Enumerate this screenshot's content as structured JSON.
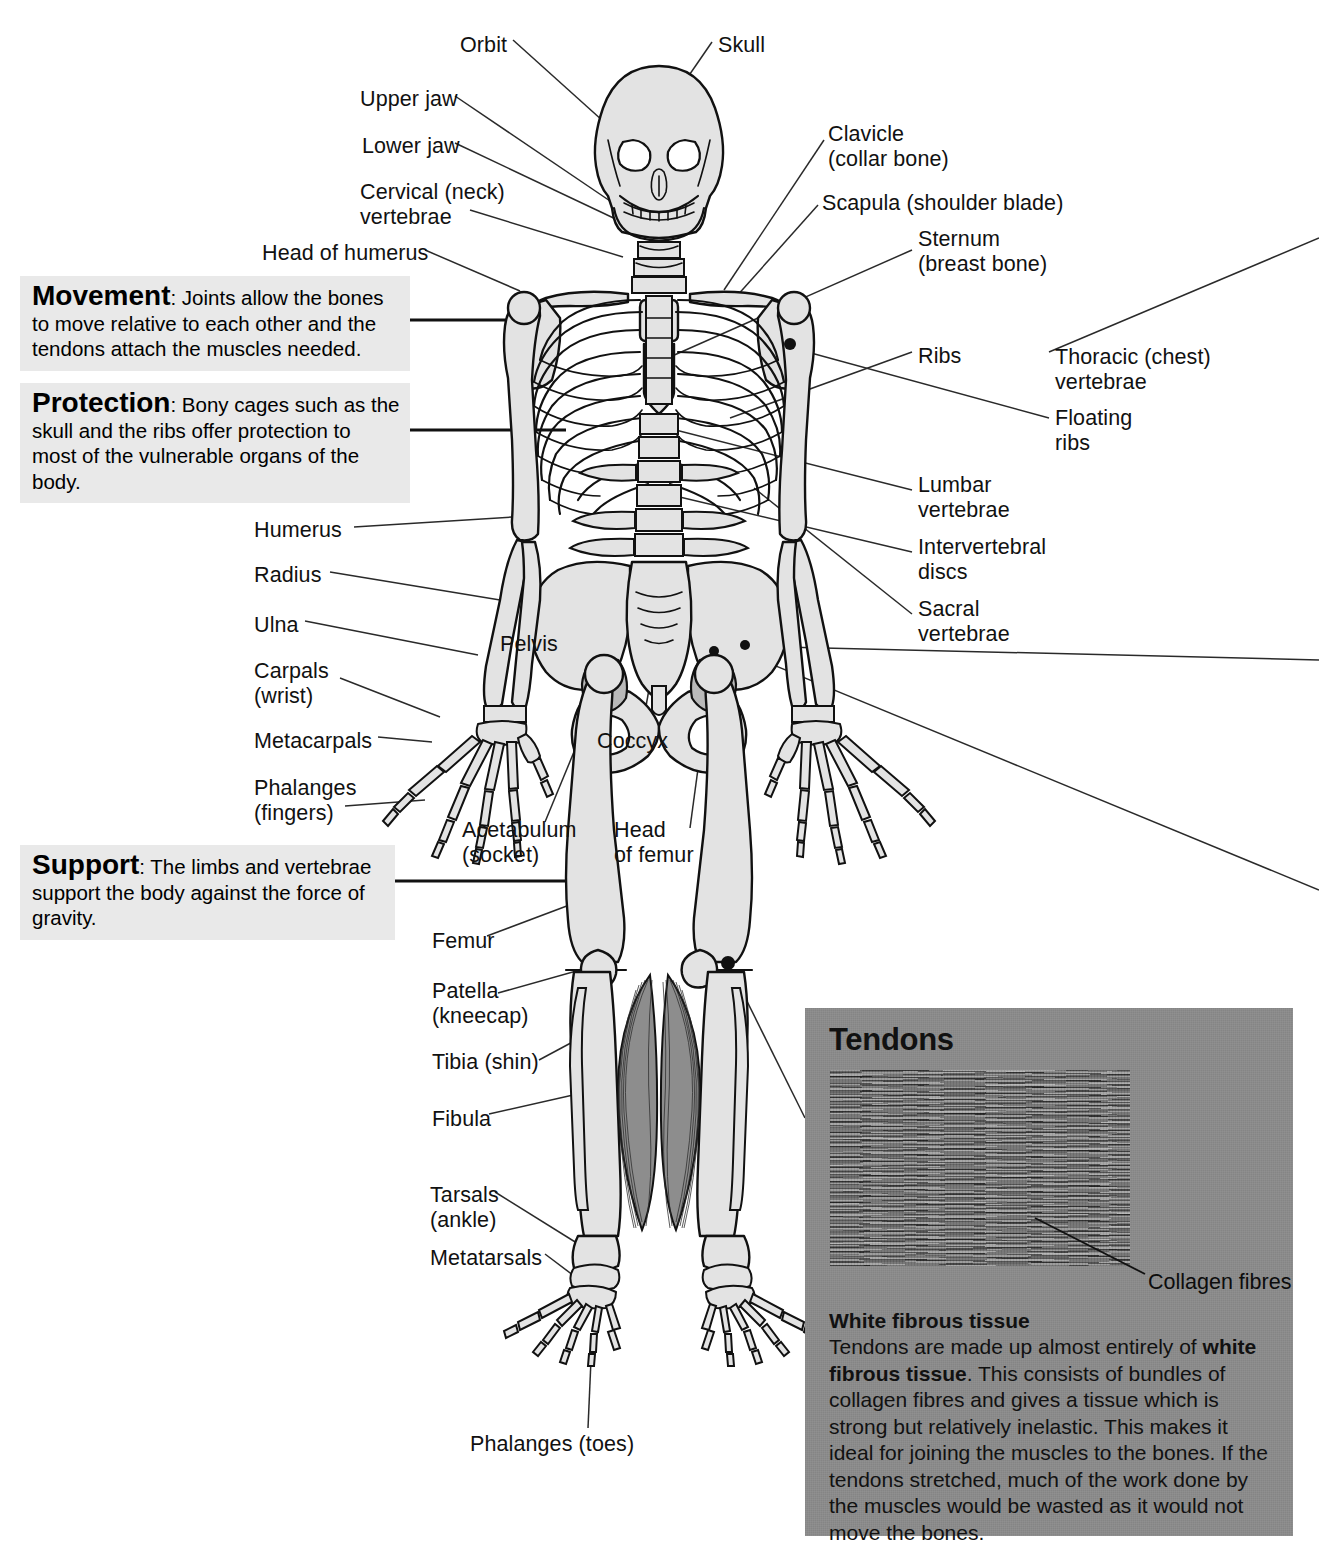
{
  "diagram": {
    "figure_name": "skeleton"
  },
  "labels_left": [
    {
      "name": "orbit",
      "text": "Orbit",
      "x": 460,
      "y": 33
    },
    {
      "name": "upper-jaw",
      "text": "Upper jaw",
      "x": 360,
      "y": 87
    },
    {
      "name": "lower-jaw",
      "text": "Lower jaw",
      "x": 362,
      "y": 134
    },
    {
      "name": "cervical-vertebrae",
      "text": "Cervical (neck)\nvertebrae",
      "x": 360,
      "y": 180
    },
    {
      "name": "head-of-humerus",
      "text": "Head of humerus",
      "x": 262,
      "y": 241
    },
    {
      "name": "humerus",
      "text": "Humerus",
      "x": 254,
      "y": 518
    },
    {
      "name": "radius",
      "text": "Radius",
      "x": 254,
      "y": 563
    },
    {
      "name": "ulna",
      "text": "Ulna",
      "x": 254,
      "y": 613
    },
    {
      "name": "carpals",
      "text": "Carpals\n(wrist)",
      "x": 254,
      "y": 659
    },
    {
      "name": "metacarpals",
      "text": "Metacarpals",
      "x": 254,
      "y": 729
    },
    {
      "name": "phalanges-fingers",
      "text": "Phalanges\n(fingers)",
      "x": 254,
      "y": 776
    },
    {
      "name": "pelvis",
      "text": "Pelvis",
      "x": 500,
      "y": 632
    },
    {
      "name": "coccyx",
      "text": "Coccyx",
      "x": 597,
      "y": 729
    },
    {
      "name": "acetabulum",
      "text": "Acetabulum\n(socket)",
      "x": 462,
      "y": 818
    },
    {
      "name": "head-of-femur",
      "text": "Head\nof femur",
      "x": 614,
      "y": 818
    },
    {
      "name": "femur",
      "text": "Femur",
      "x": 432,
      "y": 929
    },
    {
      "name": "patella",
      "text": "Patella\n(kneecap)",
      "x": 432,
      "y": 979
    },
    {
      "name": "tibia",
      "text": "Tibia (shin)",
      "x": 432,
      "y": 1050
    },
    {
      "name": "fibula",
      "text": "Fibula",
      "x": 432,
      "y": 1107
    },
    {
      "name": "tarsals",
      "text": "Tarsals\n(ankle)",
      "x": 430,
      "y": 1183
    },
    {
      "name": "metatarsals",
      "text": "Metatarsals",
      "x": 430,
      "y": 1246
    },
    {
      "name": "phalanges-toes",
      "text": "Phalanges (toes)",
      "x": 470,
      "y": 1432
    }
  ],
  "labels_right": [
    {
      "name": "skull",
      "text": "Skull",
      "x": 718,
      "y": 33
    },
    {
      "name": "clavicle",
      "text": "Clavicle\n(collar bone)",
      "x": 828,
      "y": 122
    },
    {
      "name": "scapula",
      "text": "Scapula (shoulder blade)",
      "x": 822,
      "y": 191
    },
    {
      "name": "sternum",
      "text": "Sternum\n(breast bone)",
      "x": 918,
      "y": 227
    },
    {
      "name": "ribs",
      "text": "Ribs",
      "x": 918,
      "y": 344
    },
    {
      "name": "thoracic-vertebrae",
      "text": "Thoracic (chest)\nvertebrae",
      "x": 1055,
      "y": 345
    },
    {
      "name": "floating-ribs",
      "text": "Floating\nribs",
      "x": 1055,
      "y": 406
    },
    {
      "name": "lumbar-vertebrae",
      "text": "Lumbar\nvertebrae",
      "x": 918,
      "y": 473
    },
    {
      "name": "intervertebral-discs",
      "text": "Intervertebral\ndiscs",
      "x": 918,
      "y": 535
    },
    {
      "name": "sacral-vertebrae",
      "text": "Sacral\nvertebrae",
      "x": 918,
      "y": 597
    }
  ],
  "infoboxes": [
    {
      "name": "movement",
      "heading": "Movement",
      "body": ": Joints allow the bones to move relative to each other and the tendons attach the muscles needed.",
      "x": 20,
      "y": 276,
      "w": 390,
      "h": 85
    },
    {
      "name": "protection",
      "heading": "Protection",
      "body": ": Bony cages such as the skull and the ribs offer protection to most of the vulnerable organs of the body.",
      "x": 20,
      "y": 383,
      "w": 390,
      "h": 112
    },
    {
      "name": "support",
      "heading": "Support",
      "body": ": The limbs and vertebrae support the body against the force of gravity.",
      "x": 20,
      "y": 845,
      "w": 375,
      "h": 85
    }
  ],
  "tendons_panel": {
    "title": "Tendons",
    "collagen_label": "Collagen fibres",
    "subheading": "White fibrous tissue",
    "body_before": "Tendons are made up almost entirely of ",
    "body_bold": "white fibrous tissue",
    "body_after": ". This consists of bundles of collagen fibres and gives a tissue which is strong but relatively inelastic. This makes it ideal for joining the muscles to the bones. If the tendons stretched, much of the work done by the muscles would be wasted as it would not move the bones.",
    "bg_color": "#8b8b8b",
    "micrograph_name": "collagen-fibre-micrograph"
  },
  "colors": {
    "bone_fill": "#e3e3e3",
    "bone_stroke": "#111111",
    "infobox_bg": "#e9e9e9",
    "panel_bg": "#8b8b8b",
    "muscle_fill": "#8d8d8d",
    "page_bg": "#ffffff"
  }
}
